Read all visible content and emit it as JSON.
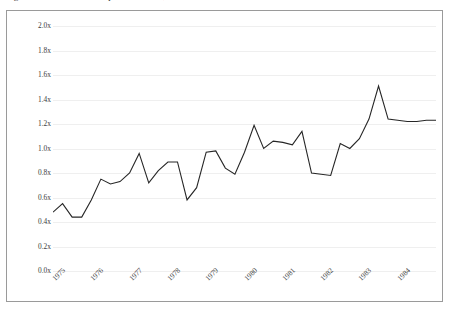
{
  "figure": {
    "clipped_title": "Figure: Ratio of annual output to baseline, 1975–1984",
    "frame_border_color": "#9a9a9a",
    "gridline_color": "#efefef",
    "line_color": "#262626",
    "background_color": "#ffffff"
  },
  "chart_data": {
    "type": "line",
    "title": "",
    "subtitle": "",
    "xlabel": "",
    "ylabel": "",
    "legend": [],
    "legend_position": "none",
    "grid": "horizontal",
    "ylim": [
      0.0,
      2.0
    ],
    "ytick_step": 0.2,
    "ytick_labels": [
      "2.0x",
      "1.8x",
      "1.6x",
      "1.4x",
      "1.2x",
      "1.0x",
      "0.8x",
      "0.6x",
      "0.4x",
      "0.2x",
      "0.0x"
    ],
    "ytick_values": [
      2.0,
      1.8,
      1.6,
      1.4,
      1.2,
      1.0,
      0.8,
      0.6,
      0.4,
      0.2,
      0.0
    ],
    "xtick_labels": [
      "1975",
      "1976",
      "1977",
      "1978",
      "1979",
      "1980",
      "1981",
      "1982",
      "1983",
      "1984"
    ],
    "xtick_values": [
      1975,
      1976,
      1977,
      1978,
      1979,
      1980,
      1981,
      1982,
      1983,
      1984
    ],
    "xlim": [
      1975,
      1985
    ],
    "xtick_rotation_deg": -45,
    "units": "x",
    "series": [
      {
        "name": "ratio",
        "color": "#262626",
        "x": [
          1975.0,
          1975.25,
          1975.5,
          1975.75,
          1976.0,
          1976.25,
          1976.5,
          1976.75,
          1977.0,
          1977.25,
          1977.5,
          1977.75,
          1978.0,
          1978.25,
          1978.5,
          1978.75,
          1979.0,
          1979.25,
          1979.5,
          1979.75,
          1980.0,
          1980.25,
          1980.5,
          1980.75,
          1981.0,
          1981.25,
          1981.5,
          1981.75,
          1982.0,
          1982.25,
          1982.5,
          1982.75,
          1983.0,
          1983.25,
          1983.5,
          1983.75,
          1984.0,
          1984.25,
          1984.5,
          1984.75,
          1985.0
        ],
        "values": [
          0.48,
          0.55,
          0.44,
          0.44,
          0.58,
          0.75,
          0.71,
          0.73,
          0.8,
          0.96,
          0.72,
          0.82,
          0.89,
          0.89,
          0.58,
          0.68,
          0.97,
          0.98,
          0.84,
          0.79,
          0.97,
          1.19,
          1.0,
          1.06,
          1.05,
          1.03,
          1.14,
          0.8,
          0.79,
          0.78,
          1.04,
          1.0,
          1.08,
          1.24,
          1.51,
          1.24,
          1.23,
          1.22,
          1.22,
          1.23,
          1.23
        ]
      }
    ],
    "notes": {
      "min_value": 0.44,
      "max_value": 1.51,
      "first_value": 0.48,
      "last_value": 1.23
    }
  }
}
